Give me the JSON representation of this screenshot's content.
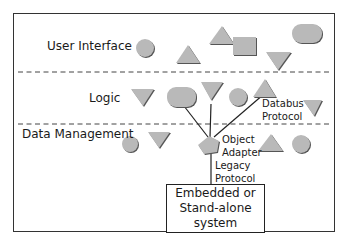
{
  "diagram": {
    "layers": [
      {
        "label": "User Interface"
      },
      {
        "label": "Logic"
      },
      {
        "label": "Data Management"
      }
    ],
    "annotations": {
      "databus": [
        "Databus",
        "Protocol"
      ],
      "object_adapter": [
        "Object",
        "Adapter"
      ],
      "legacy": [
        "Legacy",
        "Protocol"
      ]
    },
    "system_box": {
      "line1": "Embedded or",
      "line2": "Stand-alone system"
    },
    "colors": {
      "shape_fill": "#b9b9b9",
      "shape_shadow": "#555555",
      "frame": "#333333",
      "divider": "#444444"
    },
    "shapes": [
      {
        "layer": "User Interface",
        "type": "circle"
      },
      {
        "layer": "User Interface",
        "type": "triangle-up"
      },
      {
        "layer": "User Interface",
        "type": "triangle-up"
      },
      {
        "layer": "User Interface",
        "type": "square"
      },
      {
        "layer": "User Interface",
        "type": "triangle-down"
      },
      {
        "layer": "User Interface",
        "type": "rounded-rect"
      },
      {
        "layer": "Logic",
        "type": "triangle-down"
      },
      {
        "layer": "Logic",
        "type": "rounded-rect"
      },
      {
        "layer": "Logic",
        "type": "triangle-down"
      },
      {
        "layer": "Logic",
        "type": "circle"
      },
      {
        "layer": "Logic",
        "type": "triangle-up"
      },
      {
        "layer": "Logic",
        "type": "triangle-down"
      },
      {
        "layer": "Data Management",
        "type": "circle"
      },
      {
        "layer": "Data Management",
        "type": "triangle-down"
      },
      {
        "layer": "Data Management",
        "type": "pentagon"
      },
      {
        "layer": "Data Management",
        "type": "triangle-up"
      },
      {
        "layer": "Data Management",
        "type": "circle"
      }
    ]
  }
}
